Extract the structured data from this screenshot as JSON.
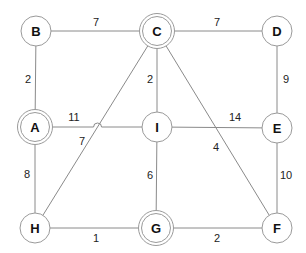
{
  "diagram": {
    "type": "weighted-undirected-graph",
    "nodes": [
      {
        "id": "B",
        "label": "B",
        "x": 36,
        "y": 31,
        "double": false
      },
      {
        "id": "C",
        "label": "C",
        "x": 157,
        "y": 31,
        "double": true
      },
      {
        "id": "D",
        "label": "D",
        "x": 277,
        "y": 31,
        "double": false
      },
      {
        "id": "A",
        "label": "A",
        "x": 35,
        "y": 127,
        "double": true
      },
      {
        "id": "I",
        "label": "I",
        "x": 157,
        "y": 127,
        "double": false
      },
      {
        "id": "E",
        "label": "E",
        "x": 277,
        "y": 128,
        "double": false
      },
      {
        "id": "H",
        "label": "H",
        "x": 35,
        "y": 228,
        "double": false
      },
      {
        "id": "G",
        "label": "G",
        "x": 156,
        "y": 228,
        "double": true
      },
      {
        "id": "F",
        "label": "F",
        "x": 277,
        "y": 228,
        "double": false
      }
    ],
    "edges": [
      {
        "from": "B",
        "to": "C",
        "weight": "7",
        "lx": 96,
        "ly": 22
      },
      {
        "from": "C",
        "to": "D",
        "weight": "7",
        "lx": 217,
        "ly": 22
      },
      {
        "from": "B",
        "to": "A",
        "weight": "2",
        "lx": 28,
        "ly": 79
      },
      {
        "from": "C",
        "to": "I",
        "weight": "2",
        "lx": 150,
        "ly": 79
      },
      {
        "from": "D",
        "to": "E",
        "weight": "9",
        "lx": 286,
        "ly": 79
      },
      {
        "from": "A",
        "to": "I",
        "weight": "11",
        "lx": 74,
        "ly": 117
      },
      {
        "from": "I",
        "to": "E",
        "weight": "14",
        "lx": 235,
        "ly": 117
      },
      {
        "from": "C",
        "to": "H",
        "weight": "7",
        "lx": 82,
        "ly": 141
      },
      {
        "from": "C",
        "to": "F",
        "weight": "4",
        "lx": 216,
        "ly": 147
      },
      {
        "from": "A",
        "to": "H",
        "weight": "8",
        "lx": 27,
        "ly": 174
      },
      {
        "from": "I",
        "to": "G",
        "weight": "6",
        "lx": 150,
        "ly": 175
      },
      {
        "from": "E",
        "to": "F",
        "weight": "10",
        "lx": 286,
        "ly": 175
      },
      {
        "from": "H",
        "to": "G",
        "weight": "1",
        "lx": 96,
        "ly": 238
      },
      {
        "from": "G",
        "to": "F",
        "weight": "2",
        "lx": 217,
        "ly": 238
      }
    ]
  }
}
